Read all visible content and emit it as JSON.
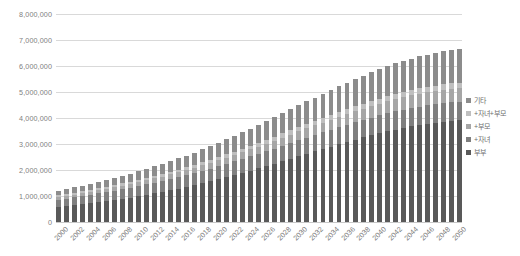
{
  "chart_data": {
    "type": "bar",
    "stacked": true,
    "title": "",
    "subtitle": "",
    "xlabel": "",
    "ylabel": "",
    "ylim": [
      0,
      8000000
    ],
    "ytick_step": 1000000,
    "ytick_labels": [
      "8,000,000",
      "7,000,000",
      "6,000,000",
      "5,000,000",
      "4,000,000",
      "3,000,000",
      "2,000,000",
      "1,000,000",
      "0"
    ],
    "ytick_values": [
      8000000,
      7000000,
      6000000,
      5000000,
      4000000,
      3000000,
      2000000,
      1000000,
      0
    ],
    "grid": true,
    "grid_axis": "y",
    "legend_position": "right",
    "categories": [
      "2000",
      "2001",
      "2002",
      "2003",
      "2004",
      "2005",
      "2006",
      "2007",
      "2008",
      "2009",
      "2010",
      "2011",
      "2012",
      "2013",
      "2014",
      "2015",
      "2016",
      "2017",
      "2018",
      "2019",
      "2020",
      "2021",
      "2022",
      "2023",
      "2024",
      "2025",
      "2026",
      "2027",
      "2028",
      "2029",
      "2030",
      "2031",
      "2032",
      "2033",
      "2034",
      "2035",
      "2036",
      "2037",
      "2038",
      "2039",
      "2040",
      "2041",
      "2042",
      "2043",
      "2044",
      "2045",
      "2046",
      "2047",
      "2048",
      "2049",
      "2050"
    ],
    "xtick_labels": [
      "2000",
      "2002",
      "2004",
      "2006",
      "2008",
      "2010",
      "2012",
      "2014",
      "2016",
      "2018",
      "2020",
      "2022",
      "2024",
      "2026",
      "2028",
      "2030",
      "2032",
      "2034",
      "2036",
      "2038",
      "2040",
      "2042",
      "2044",
      "2046",
      "2048",
      "2050"
    ],
    "xtick_every": 2,
    "series": [
      {
        "name": "부부",
        "color": "#595959",
        "values": [
          573000,
          607000,
          643000,
          681000,
          720000,
          760000,
          802000,
          846000,
          892000,
          940000,
          990000,
          1043000,
          1098000,
          1156000,
          1217000,
          1280000,
          1346000,
          1415000,
          1487000,
          1562000,
          1640000,
          1720000,
          1803000,
          1888000,
          1975000,
          2064000,
          2155000,
          2247000,
          2340000,
          2434000,
          2528000,
          2622000,
          2716000,
          2809000,
          2901000,
          2992000,
          3081000,
          3168000,
          3252000,
          3333000,
          3411000,
          3485000,
          3555000,
          3620000,
          3680000,
          3735000,
          3784000,
          3827000,
          3864000,
          3894000,
          3918000
        ]
      },
      {
        "name": "+자녀",
        "color": "#7f7f7f",
        "values": [
          283000,
          294000,
          305000,
          316000,
          327000,
          338000,
          349000,
          360000,
          371000,
          382000,
          393000,
          404000,
          415000,
          426000,
          437000,
          448000,
          459000,
          470000,
          481000,
          492000,
          503000,
          514000,
          525000,
          536000,
          547000,
          558000,
          569000,
          580000,
          591000,
          602000,
          613000,
          622000,
          631000,
          640000,
          648000,
          656000,
          663000,
          670000,
          676000,
          682000,
          687000,
          692000,
          696000,
          700000,
          703000,
          706000,
          708000,
          710000,
          711000,
          712000,
          713000
        ]
      },
      {
        "name": "+부모",
        "color": "#a6a6a6",
        "values": [
          98000,
          102000,
          106000,
          110000,
          115000,
          120000,
          125000,
          130000,
          136000,
          142000,
          148000,
          155000,
          162000,
          169000,
          177000,
          185000,
          193000,
          202000,
          211000,
          220000,
          230000,
          240000,
          250000,
          261000,
          272000,
          283000,
          294000,
          306000,
          318000,
          330000,
          342000,
          354000,
          366000,
          378000,
          390000,
          401000,
          412000,
          423000,
          433000,
          443000,
          452000,
          461000,
          469000,
          477000,
          484000,
          490000,
          496000,
          501000,
          505000,
          509000,
          512000
        ]
      },
      {
        "name": "+자녀+부모",
        "color": "#bfbfbf",
        "values": [
          72000,
          74000,
          76000,
          78000,
          80000,
          82000,
          84000,
          86000,
          88000,
          90000,
          93000,
          96000,
          99000,
          102000,
          105000,
          108000,
          111000,
          114000,
          118000,
          122000,
          126000,
          130000,
          134000,
          138000,
          142000,
          146000,
          150000,
          154000,
          158000,
          162000,
          166000,
          170000,
          174000,
          178000,
          182000,
          186000,
          189000,
          192000,
          195000,
          198000,
          201000,
          203000,
          205000,
          207000,
          209000,
          210000,
          211000,
          212000,
          213000,
          214000,
          215000
        ]
      },
      {
        "name": "기타",
        "color": "#8c8c8c",
        "values": [
          174000,
          186000,
          199000,
          212000,
          226000,
          241000,
          256000,
          272000,
          289000,
          306000,
          324000,
          343000,
          363000,
          383000,
          404000,
          426000,
          449000,
          472000,
          496000,
          521000,
          547000,
          574000,
          601000,
          629000,
          658000,
          687000,
          717000,
          747000,
          778000,
          809000,
          840000,
          871000,
          902000,
          933000,
          963000,
          993000,
          1022000,
          1050000,
          1077000,
          1103000,
          1128000,
          1151000,
          1173000,
          1193000,
          1212000,
          1229000,
          1244000,
          1258000,
          1270000,
          1280000,
          1288000
        ]
      }
    ],
    "totals": [
      1200000,
      1263000,
      1329000,
      1397000,
      1468000,
      1541000,
      1616000,
      1694000,
      1776000,
      1860000,
      1948000,
      2041000,
      2137000,
      2236000,
      2340000,
      2447000,
      2558000,
      2673000,
      2793000,
      2917000,
      3046000,
      3178000,
      3313000,
      3452000,
      3594000,
      3738000,
      3885000,
      4034000,
      4185000,
      4337000,
      4489000,
      4639000,
      4789000,
      4938000,
      5084000,
      5228000,
      5367000,
      5503000,
      5633000,
      5759000,
      5879000,
      5992000,
      6098000,
      6197000,
      6288000,
      6370000,
      6443000,
      6508000,
      6563000,
      6609000,
      6646000
    ]
  },
  "legend": {
    "items": [
      {
        "label": "기타",
        "color": "#8c8c8c"
      },
      {
        "label": "+자녀+부모",
        "color": "#bfbfbf"
      },
      {
        "label": "+부모",
        "color": "#a6a6a6"
      },
      {
        "label": "+자녀",
        "color": "#7f7f7f"
      },
      {
        "label": "부부",
        "color": "#595959"
      }
    ]
  },
  "style": {
    "background": "#ffffff",
    "gridline_color": "#d9d9d9",
    "axis_text_color": "#808080"
  }
}
